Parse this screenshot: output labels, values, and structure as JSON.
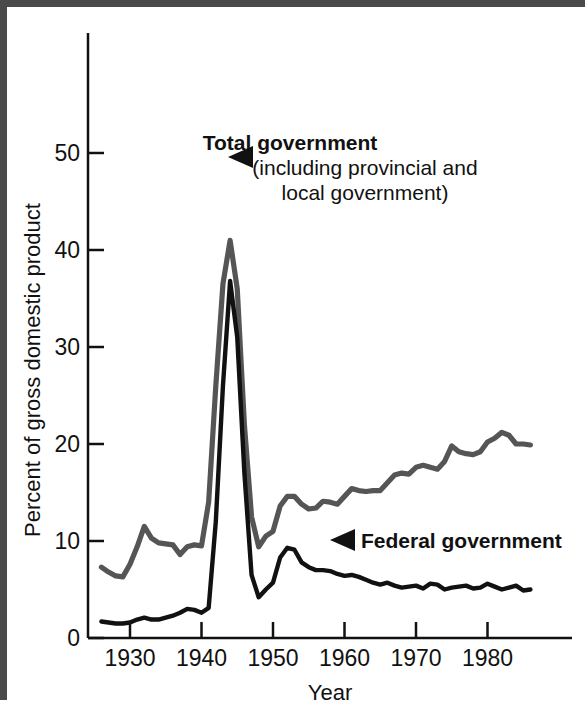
{
  "chart_data": {
    "type": "line",
    "title": "",
    "xlabel": "Year",
    "ylabel": "Percent of gross domestic product",
    "xlim": [
      1926,
      1986
    ],
    "ylim": [
      0,
      52
    ],
    "xticks": [
      1930,
      1940,
      1950,
      1960,
      1970,
      1980
    ],
    "xtick_labels": [
      "1930",
      "1940",
      "1950",
      "1960",
      "1970",
      "1980"
    ],
    "yticks": [
      0,
      10,
      20,
      30,
      40,
      50
    ],
    "ytick_labels": [
      "0",
      "10",
      "20",
      "30",
      "40",
      "50"
    ],
    "grid": false,
    "legend": "inline-annotations",
    "series": [
      {
        "name": "Total government (including provincial and local government)",
        "color": "#555555",
        "x": [
          1926,
          1927,
          1928,
          1929,
          1930,
          1931,
          1932,
          1933,
          1934,
          1935,
          1936,
          1937,
          1938,
          1939,
          1940,
          1941,
          1942,
          1943,
          1944,
          1945,
          1946,
          1947,
          1948,
          1949,
          1950,
          1951,
          1952,
          1953,
          1954,
          1955,
          1956,
          1957,
          1958,
          1959,
          1960,
          1961,
          1962,
          1963,
          1964,
          1965,
          1966,
          1967,
          1968,
          1969,
          1970,
          1971,
          1972,
          1973,
          1974,
          1975,
          1976,
          1977,
          1978,
          1979,
          1980,
          1981,
          1982,
          1983,
          1984,
          1985,
          1986
        ],
        "y": [
          7.3,
          6.8,
          6.4,
          6.3,
          7.6,
          9.4,
          11.5,
          10.3,
          9.8,
          9.7,
          9.6,
          8.6,
          9.4,
          9.6,
          9.5,
          14.0,
          26.0,
          36.5,
          41.0,
          36.0,
          22.0,
          12.5,
          9.4,
          10.5,
          11.0,
          13.6,
          14.6,
          14.6,
          13.8,
          13.3,
          13.4,
          14.1,
          14.0,
          13.8,
          14.6,
          15.4,
          15.2,
          15.1,
          15.2,
          15.2,
          16.0,
          16.8,
          17.0,
          16.9,
          17.6,
          17.8,
          17.6,
          17.4,
          18.2,
          19.8,
          19.2,
          19.0,
          18.9,
          19.2,
          20.2,
          20.6,
          21.2,
          20.9,
          20.0,
          20.0,
          19.9
        ]
      },
      {
        "name": "Federal government",
        "color": "#111111",
        "x": [
          1926,
          1927,
          1928,
          1929,
          1930,
          1931,
          1932,
          1933,
          1934,
          1935,
          1936,
          1937,
          1938,
          1939,
          1940,
          1941,
          1942,
          1943,
          1944,
          1945,
          1946,
          1947,
          1948,
          1949,
          1950,
          1951,
          1952,
          1953,
          1954,
          1955,
          1956,
          1957,
          1958,
          1959,
          1960,
          1961,
          1962,
          1963,
          1964,
          1965,
          1966,
          1967,
          1968,
          1969,
          1970,
          1971,
          1972,
          1973,
          1974,
          1975,
          1976,
          1977,
          1978,
          1979,
          1980,
          1981,
          1982,
          1983,
          1984,
          1985,
          1986
        ],
        "y": [
          1.7,
          1.6,
          1.5,
          1.5,
          1.6,
          1.9,
          2.1,
          1.9,
          1.9,
          2.1,
          2.3,
          2.6,
          3.0,
          2.9,
          2.6,
          3.1,
          12.0,
          26.0,
          36.8,
          31.0,
          17.0,
          6.5,
          4.2,
          5.0,
          5.7,
          8.3,
          9.3,
          9.1,
          7.8,
          7.3,
          7.0,
          7.0,
          6.9,
          6.6,
          6.4,
          6.5,
          6.3,
          6.0,
          5.7,
          5.5,
          5.7,
          5.4,
          5.2,
          5.3,
          5.4,
          5.1,
          5.6,
          5.5,
          5.0,
          5.2,
          5.3,
          5.4,
          5.1,
          5.2,
          5.6,
          5.3,
          5.0,
          5.2,
          5.4,
          4.9,
          5.0
        ]
      }
    ],
    "annotations": [
      {
        "id": "total-government",
        "lines": [
          "Total government",
          "(including provincial and",
          "local government)"
        ],
        "bold_lines": [
          true,
          false,
          false
        ],
        "marker": "left-triangle"
      },
      {
        "id": "federal-government",
        "lines": [
          "Federal government"
        ],
        "bold_lines": [
          true
        ],
        "marker": "left-triangle"
      }
    ]
  }
}
